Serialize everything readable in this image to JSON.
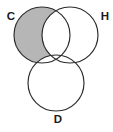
{
  "figure": {
    "type": "venn-diagram",
    "set_count": 3,
    "width": 113,
    "height": 132,
    "background_color": "#ffffff",
    "stroke_color": "#2a2a2a",
    "shaded_fill_color": "#b6b6b6",
    "shaded_region_description": "C only"
  },
  "sets": [
    {
      "id": "C",
      "label": "C",
      "cx": 42,
      "cy": 35,
      "r": 28,
      "label_x": 11,
      "label_y": 17,
      "shaded": true
    },
    {
      "id": "H",
      "label": "H",
      "cx": 70,
      "cy": 35,
      "r": 28,
      "label_x": 105,
      "label_y": 17,
      "shaded": false
    },
    {
      "id": "D",
      "label": "D",
      "cx": 56,
      "cy": 83,
      "r": 28,
      "label_x": 58,
      "label_y": 120,
      "shaded": false
    }
  ]
}
